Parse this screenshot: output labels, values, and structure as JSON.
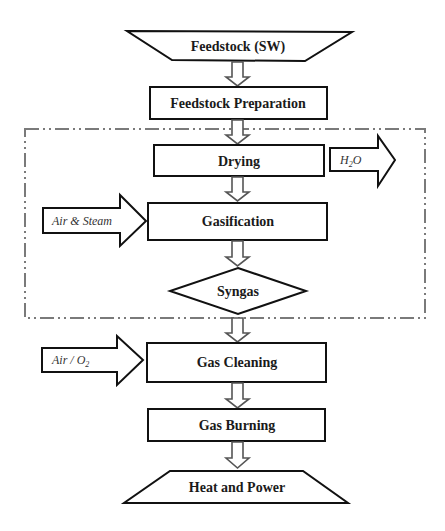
{
  "diagram": {
    "nodes": [
      {
        "id": "feedstock",
        "label": "Feedstock (SW)",
        "shape": "trapezoid-inverted"
      },
      {
        "id": "feedstock_prep",
        "label": "Feedstock Preparation",
        "shape": "rectangle"
      },
      {
        "id": "drying",
        "label": "Drying",
        "shape": "rectangle"
      },
      {
        "id": "gasification",
        "label": "Gasification",
        "shape": "rectangle"
      },
      {
        "id": "syngas",
        "label": "Syngas",
        "shape": "diamond"
      },
      {
        "id": "gas_cleaning",
        "label": "Gas Cleaning",
        "shape": "rectangle"
      },
      {
        "id": "gas_burning",
        "label": "Gas Burning",
        "shape": "rectangle"
      },
      {
        "id": "heat_power",
        "label": "Heat and Power",
        "shape": "trapezoid"
      }
    ],
    "side_flows": [
      {
        "id": "h2o_out",
        "label_main": "H",
        "label_sub": "2",
        "label_tail": "O",
        "direction": "out",
        "attached_to": "drying"
      },
      {
        "id": "air_steam_in",
        "label": "Air & Steam",
        "direction": "in",
        "attached_to": "gasification"
      },
      {
        "id": "air_o2_in",
        "label_main": "Air / O",
        "label_sub": "2",
        "direction": "in",
        "attached_to": "gas_cleaning"
      }
    ],
    "edges": [
      [
        "feedstock",
        "feedstock_prep"
      ],
      [
        "feedstock_prep",
        "drying"
      ],
      [
        "drying",
        "gasification"
      ],
      [
        "gasification",
        "syngas"
      ],
      [
        "syngas",
        "gas_cleaning"
      ],
      [
        "gas_cleaning",
        "gas_burning"
      ],
      [
        "gas_burning",
        "heat_power"
      ]
    ],
    "boundary": {
      "encloses": [
        "drying",
        "gasification",
        "syngas"
      ],
      "style": "dash-dot"
    },
    "colors": {
      "stroke": "#111111",
      "flow_arrow": "#555555",
      "boundary": "#7a7a7a",
      "background": "#ffffff"
    }
  }
}
